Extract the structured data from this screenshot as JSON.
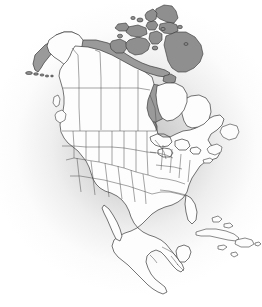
{
  "figure": {
    "title": "North America political outline map",
    "projection_note": "Lambert conformal style continental outline",
    "width_px": 262,
    "height_px": 307
  },
  "style": {
    "land_fill": "#fdfdfd",
    "outline_color": "#3a3a3a",
    "highlight_fill": "#9a9a9a",
    "island_fill": "#8f8f8f",
    "internal_border_color": "#4a4a4a",
    "background_base": "#ffffff",
    "background_shadow": "#969696"
  },
  "regions": {
    "countries": [
      {
        "name": "Canada",
        "fill": "land",
        "subdivisions": "provinces-and-territories"
      },
      {
        "name": "United States of America",
        "fill": "land",
        "subdivisions": "states"
      },
      {
        "name": "Mexico",
        "fill": "land",
        "subdivisions": "none"
      },
      {
        "name": "Guatemala",
        "fill": "land",
        "subdivisions": "none"
      },
      {
        "name": "Belize",
        "fill": "land",
        "subdivisions": "none"
      },
      {
        "name": "Honduras",
        "fill": "land",
        "subdivisions": "none"
      },
      {
        "name": "El Salvador",
        "fill": "land",
        "subdivisions": "none"
      },
      {
        "name": "Nicaragua",
        "fill": "land",
        "subdivisions": "none"
      },
      {
        "name": "Costa Rica",
        "fill": "land",
        "subdivisions": "none"
      },
      {
        "name": "Panama",
        "fill": "land",
        "subdivisions": "none"
      },
      {
        "name": "Cuba",
        "fill": "land",
        "subdivisions": "none"
      },
      {
        "name": "Bahamas",
        "fill": "land",
        "subdivisions": "none"
      },
      {
        "name": "Jamaica",
        "fill": "land",
        "subdivisions": "none"
      },
      {
        "name": "Hispaniola",
        "fill": "land",
        "subdivisions": "none"
      }
    ],
    "shaded_gray": [
      {
        "name": "Hudson Bay",
        "type": "water-body"
      },
      {
        "name": "Canadian Arctic Archipelago",
        "type": "island-group"
      },
      {
        "name": "Baffin Island",
        "type": "island"
      },
      {
        "name": "Victoria Island",
        "type": "island"
      },
      {
        "name": "Banks Island",
        "type": "island"
      },
      {
        "name": "Ellesmere Island",
        "type": "island"
      },
      {
        "name": "Devon Island",
        "type": "island"
      },
      {
        "name": "Arctic northern coastal strip",
        "type": "coastal-band"
      },
      {
        "name": "Western Alaska coastal strip",
        "type": "coastal-band"
      },
      {
        "name": "Aleutian Islands",
        "type": "island-chain"
      },
      {
        "name": "Newfoundland approaches",
        "type": "island"
      }
    ],
    "notable_features": [
      "Great Lakes",
      "Gulf of Mexico",
      "Florida Peninsula",
      "Baja California",
      "Yucatan Peninsula",
      "Alaska Peninsula",
      "Labrador",
      "Vancouver Island"
    ]
  },
  "legend": {
    "visible": false,
    "entries": []
  },
  "labels": {
    "visible": false,
    "text": []
  }
}
